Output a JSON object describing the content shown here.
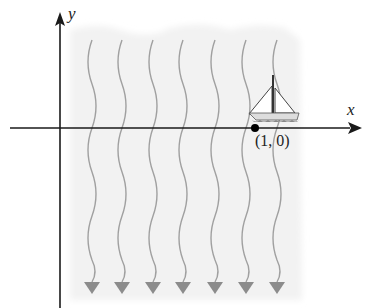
{
  "diagram": {
    "axes": {
      "x_label": "x",
      "y_label": "y"
    },
    "point": {
      "label": "(1, 0)",
      "x": 1,
      "y": 0
    },
    "current_lines": {
      "count": 7,
      "direction": "down"
    },
    "boat": {
      "icon": "sailboat-icon",
      "position": "at (1, 0) on x-axis"
    },
    "colors": {
      "axis": "#1a1a1a",
      "water_shading": "#f2f2f2",
      "current_line": "#9a9a9a",
      "arrowhead": "#8c8c8c",
      "point": "#000000"
    }
  }
}
